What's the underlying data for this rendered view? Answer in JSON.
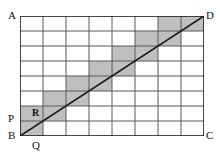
{
  "figure": {
    "type": "geometry-grid-diagram",
    "colors": {
      "background": "#ffffff",
      "grid_line": "#595959",
      "border_line": "#1a1a1a",
      "diagonal_line": "#1a1a1a",
      "shade_fill": "#bfbfbf",
      "label_text": "#111111"
    },
    "grid": {
      "columns": 8,
      "rows": 8,
      "cell_width": 23,
      "cell_height": 15,
      "origin_x": 0,
      "origin_y": 0
    },
    "rectangle": {
      "corners": [
        "A",
        "B",
        "C",
        "D"
      ],
      "top_left": "A",
      "bottom_left": "B",
      "bottom_right": "C",
      "top_right": "D"
    },
    "diagonal": {
      "from": "B",
      "to": "D",
      "from_point": [
        0,
        120
      ],
      "to_point": [
        184,
        0
      ]
    },
    "shaded_cells": [
      {
        "col": 0,
        "row": 7
      },
      {
        "col": 0,
        "row": 6
      },
      {
        "col": 1,
        "row": 6
      },
      {
        "col": 1,
        "row": 5
      },
      {
        "col": 2,
        "row": 5
      },
      {
        "col": 2,
        "row": 4
      },
      {
        "col": 3,
        "row": 4
      },
      {
        "col": 3,
        "row": 3
      },
      {
        "col": 4,
        "row": 3
      },
      {
        "col": 4,
        "row": 2
      },
      {
        "col": 5,
        "row": 2
      },
      {
        "col": 5,
        "row": 1
      },
      {
        "col": 6,
        "row": 1
      },
      {
        "col": 6,
        "row": 0
      },
      {
        "col": 7,
        "row": 0
      }
    ],
    "labels": {
      "A": "A",
      "B": "B",
      "C": "C",
      "D": "D",
      "P": "P",
      "Q": "Q",
      "R": "R"
    }
  }
}
